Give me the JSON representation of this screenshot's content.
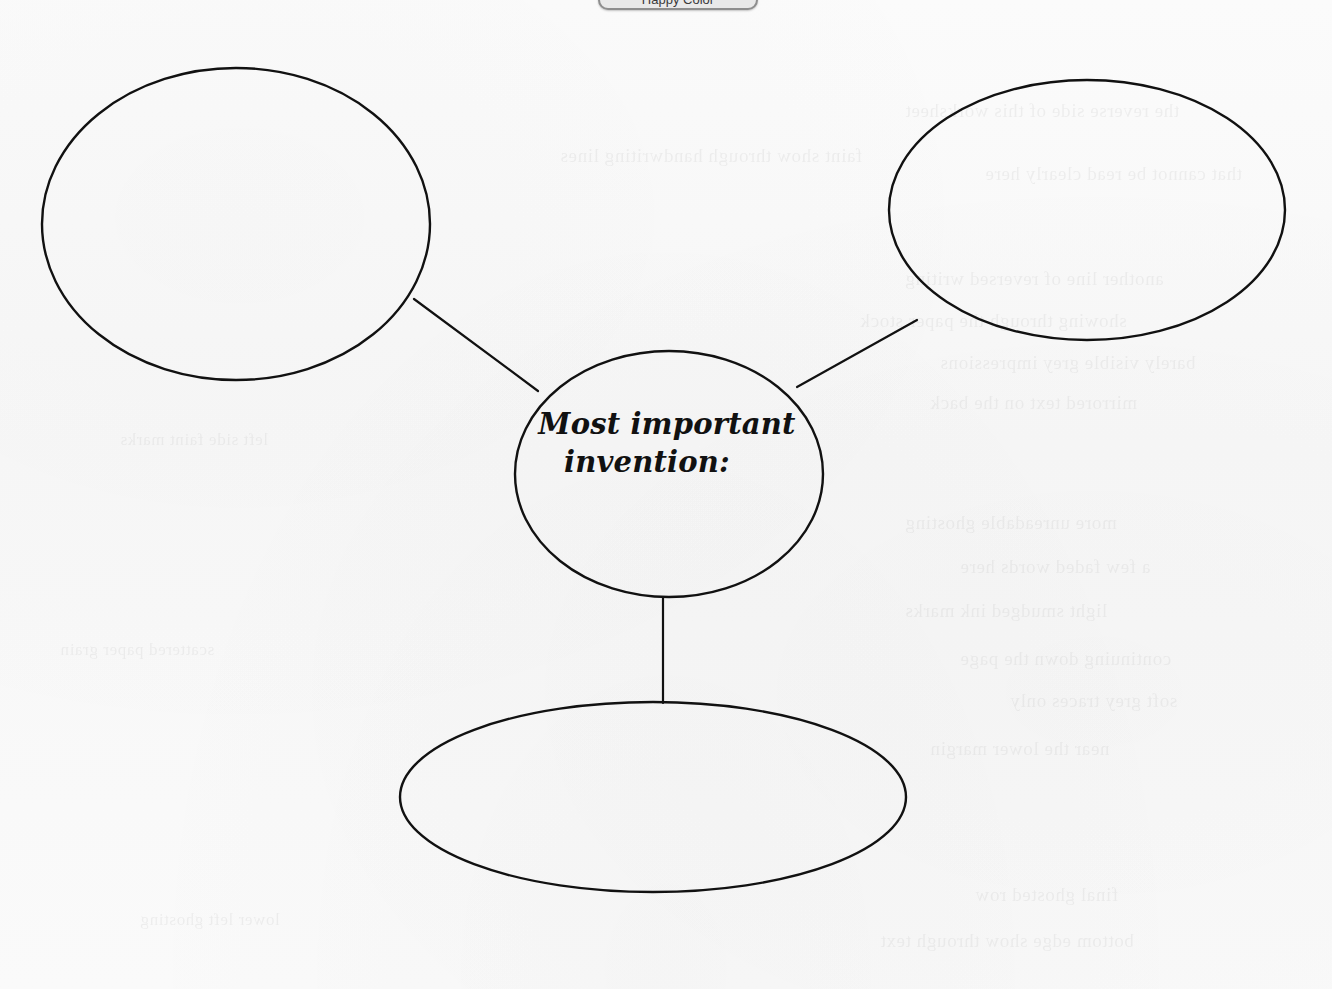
{
  "page": {
    "width": 1332,
    "height": 989,
    "background_color": "#fafafa",
    "ink_color": "#111111",
    "document_type": "graphic-organizer-worksheet"
  },
  "top_chip": {
    "label": "Happy Color",
    "visible_fraction": "bottom sliver only, clipped by top edge"
  },
  "diagram": {
    "type": "idea-web",
    "center_node": {
      "name": "center-node",
      "label_line_1": "Most important",
      "label_line_2": "invention:",
      "shape": "ellipse",
      "cx": 669,
      "cy": 474,
      "rx": 154,
      "ry": 123,
      "filled_in": false
    },
    "branch_nodes": [
      {
        "name": "branch-node-top-left",
        "label": "",
        "shape": "ellipse",
        "cx": 236,
        "cy": 224,
        "rx": 194,
        "ry": 156,
        "filled_in": false
      },
      {
        "name": "branch-node-top-right",
        "label": "",
        "shape": "ellipse",
        "cx": 1087,
        "cy": 210,
        "rx": 198,
        "ry": 130,
        "filled_in": false
      },
      {
        "name": "branch-node-bottom",
        "label": "",
        "shape": "ellipse",
        "cx": 653,
        "cy": 797,
        "rx": 253,
        "ry": 95,
        "filled_in": false
      }
    ],
    "connectors": [
      {
        "name": "connector-center-to-top-left",
        "x1": 414,
        "y1": 299,
        "x2": 538,
        "y2": 391
      },
      {
        "name": "connector-center-to-top-right",
        "x1": 797,
        "y1": 387,
        "x2": 917,
        "y2": 320
      },
      {
        "name": "connector-center-to-bottom",
        "x1": 663,
        "y1": 597,
        "x2": 663,
        "y2": 703
      }
    ]
  },
  "ghost_text": {
    "description": "illegible bleed-through text from the reverse side of the sheet",
    "lines": [
      {
        "text": "the reverse side of this worksheet",
        "x": 905,
        "y": 100,
        "size": 19
      },
      {
        "text": "faint show through handwriting lines",
        "x": 560,
        "y": 145,
        "size": 19
      },
      {
        "text": "that cannot be read clearly here",
        "x": 985,
        "y": 163,
        "size": 19
      },
      {
        "text": "another line of reversed writing",
        "x": 905,
        "y": 268,
        "size": 19
      },
      {
        "text": "showing through the paper stock",
        "x": 860,
        "y": 310,
        "size": 19
      },
      {
        "text": "barely visible grey impressions",
        "x": 940,
        "y": 352,
        "size": 19
      },
      {
        "text": "mirrored text on the back",
        "x": 930,
        "y": 392,
        "size": 19
      },
      {
        "text": "more unreadable ghosting",
        "x": 905,
        "y": 512,
        "size": 19
      },
      {
        "text": "a few faded words here",
        "x": 960,
        "y": 556,
        "size": 19
      },
      {
        "text": "light smudged ink marks",
        "x": 905,
        "y": 600,
        "size": 19
      },
      {
        "text": "continuing down the page",
        "x": 960,
        "y": 648,
        "size": 19
      },
      {
        "text": "soft grey traces only",
        "x": 1010,
        "y": 690,
        "size": 19
      },
      {
        "text": "near the lower margin",
        "x": 930,
        "y": 738,
        "size": 19
      },
      {
        "text": "final ghosted row",
        "x": 975,
        "y": 884,
        "size": 19
      },
      {
        "text": "bottom edge show through text",
        "x": 880,
        "y": 930,
        "size": 19
      },
      {
        "text": "left side faint marks",
        "x": 120,
        "y": 430,
        "size": 17
      },
      {
        "text": "scattered paper grain",
        "x": 60,
        "y": 640,
        "size": 17
      },
      {
        "text": "lower left ghosting",
        "x": 140,
        "y": 910,
        "size": 17
      }
    ]
  }
}
